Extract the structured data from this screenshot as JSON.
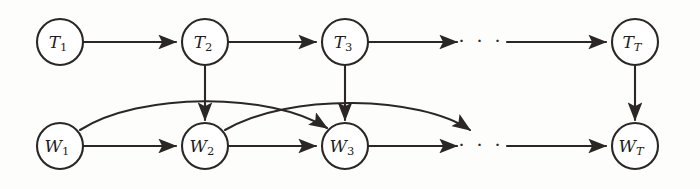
{
  "figure": {
    "type": "directed-graph",
    "background_color": "#fdfdfc",
    "stroke_color": "#2a2724",
    "node_fill": "#ffffff",
    "node_radius": 23,
    "rows": [
      {
        "name": "topic-row",
        "y": 42,
        "nodes": [
          {
            "id": "T1",
            "base": "T",
            "sub": "1",
            "sub_italic": false,
            "x": 60,
            "y": 42
          },
          {
            "id": "T2",
            "base": "T",
            "sub": "2",
            "sub_italic": false,
            "x": 205,
            "y": 42
          },
          {
            "id": "T3",
            "base": "T",
            "sub": "3",
            "sub_italic": false,
            "x": 345,
            "y": 42
          },
          {
            "id": "TT",
            "base": "T",
            "sub": "T",
            "sub_italic": true,
            "x": 635,
            "y": 42
          }
        ],
        "ellipsis": {
          "id": "topic-ellipsis",
          "text": "· · ·",
          "x": 481,
          "y": 42
        }
      },
      {
        "name": "word-row",
        "y": 146,
        "nodes": [
          {
            "id": "W1",
            "base": "W",
            "sub": "1",
            "sub_italic": false,
            "x": 60,
            "y": 146
          },
          {
            "id": "W2",
            "base": "W",
            "sub": "2",
            "sub_italic": false,
            "x": 205,
            "y": 146
          },
          {
            "id": "W3",
            "base": "W",
            "sub": "3",
            "sub_italic": false,
            "x": 345,
            "y": 146
          },
          {
            "id": "WT",
            "base": "W",
            "sub": "T",
            "sub_italic": true,
            "x": 635,
            "y": 146
          }
        ],
        "ellipsis": {
          "id": "word-ellipsis",
          "text": "· · ·",
          "x": 481,
          "y": 146
        }
      }
    ],
    "edges": [
      {
        "id": "T1-T2",
        "from": "T1",
        "to": "T2",
        "kind": "horizontal"
      },
      {
        "id": "T2-T3",
        "from": "T2",
        "to": "T3",
        "kind": "horizontal"
      },
      {
        "id": "T3-dots",
        "from": "T3",
        "to": "topic-ellipsis",
        "kind": "horizontal"
      },
      {
        "id": "dots-TT",
        "from": "topic-ellipsis",
        "to": "TT",
        "kind": "horizontal"
      },
      {
        "id": "W1-W2",
        "from": "W1",
        "to": "W2",
        "kind": "horizontal"
      },
      {
        "id": "W2-W3",
        "from": "W2",
        "to": "W3",
        "kind": "horizontal"
      },
      {
        "id": "W3-dots",
        "from": "W3",
        "to": "word-ellipsis",
        "kind": "horizontal"
      },
      {
        "id": "dots-WT",
        "from": "word-ellipsis",
        "to": "WT",
        "kind": "horizontal"
      },
      {
        "id": "T2-W2",
        "from": "T2",
        "to": "W2",
        "kind": "vertical"
      },
      {
        "id": "T3-W3",
        "from": "T3",
        "to": "W3",
        "kind": "vertical"
      },
      {
        "id": "TT-WT",
        "from": "TT",
        "to": "WT",
        "kind": "vertical"
      },
      {
        "id": "W1-W3",
        "from": "W1",
        "to": "W3",
        "kind": "curved-skip"
      },
      {
        "id": "W2-Wlater",
        "from": "W2",
        "to": "word-ellipsis",
        "kind": "curved-skip"
      }
    ]
  }
}
